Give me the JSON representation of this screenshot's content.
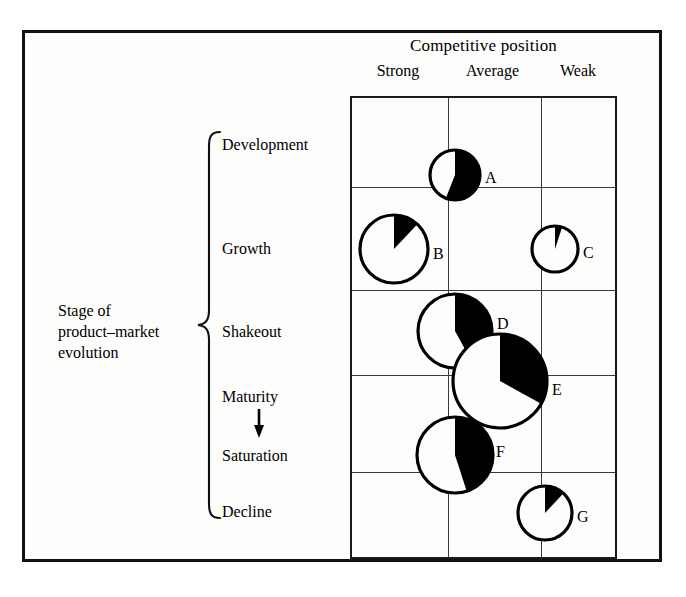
{
  "figure": {
    "background_color": "#fdfdfc",
    "ink_color": "#000000"
  },
  "x_axis": {
    "title": "Competitive position",
    "categories": [
      "Strong",
      "Average",
      "Weak"
    ]
  },
  "y_axis": {
    "title_line1": "Stage of",
    "title_line2": "product–market",
    "title_line3": "evolution",
    "categories": [
      "Development",
      "Growth",
      "Shakeout",
      "Maturity",
      "Saturation",
      "Decline"
    ],
    "arrow_between": "Maturity → Saturation"
  },
  "chart_data": {
    "type": "scatter",
    "title": "",
    "xlabel": "Competitive position",
    "ylabel": "Stage of product-market evolution",
    "x_categories": [
      "Strong",
      "Average",
      "Weak"
    ],
    "y_categories": [
      "Development",
      "Growth",
      "Shakeout",
      "Maturity",
      "Saturation",
      "Decline"
    ],
    "grid": true,
    "legend": "none",
    "marker_style": "pie-bubble",
    "note": "Each bubble is a circle whose area encodes business size; the black wedge (starting at 12 o'clock, sweeping clockwise) encodes market share.",
    "points": [
      {
        "label": "A",
        "x_position": "Strong/Average boundary",
        "y_position": "Development/Growth boundary",
        "radius_px": 25,
        "share_fraction": 0.56,
        "cx": 455,
        "cy": 175,
        "label_dx": 30,
        "label_dy": 4
      },
      {
        "label": "B",
        "x_position": "Strong",
        "y_position": "Growth",
        "radius_px": 34,
        "share_fraction": 0.12,
        "cx": 394,
        "cy": 249,
        "label_dx": 39,
        "label_dy": 6
      },
      {
        "label": "C",
        "x_position": "Weak",
        "y_position": "Growth",
        "radius_px": 23,
        "share_fraction": 0.05,
        "cx": 555,
        "cy": 249,
        "label_dx": 28,
        "label_dy": 5
      },
      {
        "label": "D",
        "x_position": "Strong/Average boundary",
        "y_position": "Shakeout",
        "radius_px": 37,
        "share_fraction": 0.42,
        "cx": 455,
        "cy": 331,
        "label_dx": 42,
        "label_dy": -6
      },
      {
        "label": "E",
        "x_position": "Average",
        "y_position": "Maturity",
        "radius_px": 47,
        "share_fraction": 0.33,
        "cx": 500,
        "cy": 381,
        "label_dx": 52,
        "label_dy": 10
      },
      {
        "label": "F",
        "x_position": "Strong/Average boundary",
        "y_position": "Saturation",
        "radius_px": 38,
        "share_fraction": 0.45,
        "cx": 455,
        "cy": 455,
        "label_dx": 41,
        "label_dy": -2
      },
      {
        "label": "G",
        "x_position": "Weak",
        "y_position": "Decline",
        "radius_px": 27,
        "share_fraction": 0.12,
        "cx": 545,
        "cy": 513,
        "label_dx": 32,
        "label_dy": 5
      }
    ]
  },
  "layout": {
    "grid": {
      "left": 350,
      "top": 96,
      "width": 267,
      "height": 463,
      "column_dividers_px": [
        96,
        189
      ],
      "row_dividers_px": [
        89,
        192,
        277,
        374
      ]
    },
    "stage_label_tops": {
      "Development": 136,
      "Growth": 240,
      "Shakeout": 323,
      "Maturity": 388,
      "Saturation": 447,
      "Decline": 503
    }
  }
}
